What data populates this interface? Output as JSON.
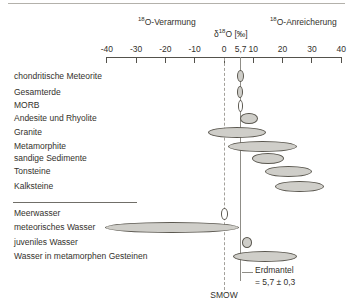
{
  "header": {
    "left": {
      "sup": "18",
      "text": "O-Verarmung"
    },
    "center": {
      "pre": "δ",
      "sup": "18",
      "post": "O [‰]"
    },
    "right": {
      "sup": "18",
      "text": "O-Anreicherung"
    }
  },
  "chart_data": {
    "type": "range-ellipse",
    "xlabel": "δ18O [‰]",
    "axis": {
      "min": -40,
      "max": 40,
      "ticks": [
        {
          "v": -40,
          "label": "-40",
          "mark": true
        },
        {
          "v": -30,
          "label": "-30",
          "mark": true
        },
        {
          "v": -20,
          "label": "-20",
          "mark": true
        },
        {
          "v": -10,
          "label": "-10",
          "mark": true
        },
        {
          "v": 0,
          "label": "0",
          "mark": true
        },
        {
          "v": 5.7,
          "label": "5,7",
          "mark": false
        },
        {
          "v": 10,
          "label": "10",
          "mark": true
        },
        {
          "v": 20,
          "label": "20",
          "mark": true
        },
        {
          "v": 30,
          "label": "30",
          "mark": true
        },
        {
          "v": 40,
          "label": "40",
          "mark": true
        }
      ]
    },
    "references": [
      {
        "id": "smow",
        "value": 0,
        "style": "dashed",
        "label": "SMOW"
      },
      {
        "id": "mantle",
        "value": 5.7,
        "style": "solid",
        "label_line1": "Erdmantel",
        "label_line2": "= 5,7 ± 0,3"
      }
    ],
    "groups": [
      {
        "name": "rocks",
        "rows": [
          {
            "label": "chondritische Meteorite",
            "min": 4.3,
            "max": 6.7,
            "fill": "gray"
          },
          {
            "label": "Gesamterde",
            "min": 4.4,
            "max": 6.5,
            "fill": "gray"
          },
          {
            "label": "MORB",
            "min": 4.8,
            "max": 6.5,
            "fill": "white"
          },
          {
            "label": "Andesite und Rhyolite",
            "min": 5.5,
            "max": 11.5,
            "fill": "gray"
          },
          {
            "label": "Granite",
            "min": -5.5,
            "max": 14.5,
            "fill": "gray"
          },
          {
            "label": "Metamorphite",
            "min": 1.5,
            "max": 25,
            "fill": "gray"
          },
          {
            "label": "sandige Sedimente",
            "min": 9.5,
            "max": 20.5,
            "fill": "gray"
          },
          {
            "label": "Tonsteine",
            "min": 14,
            "max": 30,
            "fill": "gray"
          },
          {
            "label": "Kalksteine",
            "min": 17.5,
            "max": 34,
            "fill": "gray"
          }
        ]
      },
      {
        "name": "waters",
        "rows": [
          {
            "label": "Meerwasser",
            "min": -1,
            "max": 1.5,
            "fill": "white"
          },
          {
            "label": "meteorisches Wasser",
            "min": -40.5,
            "max": 5,
            "fill": "gray"
          },
          {
            "label": "juveniles Wasser",
            "min": 6,
            "max": 9.5,
            "fill": "gray"
          },
          {
            "label": "Wasser in metamorphen Gesteinen",
            "min": 3,
            "max": 25,
            "fill": "gray"
          }
        ]
      }
    ],
    "colors": {
      "ellipse_fill": "#cfcec9",
      "ellipse_stroke": "#5a574f",
      "axis": "#54524c",
      "reference_line": "#8f8d87",
      "text": "#33312c"
    }
  }
}
